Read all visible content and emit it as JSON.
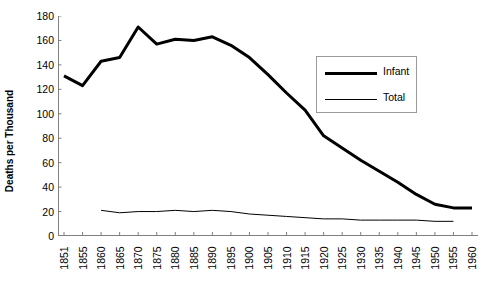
{
  "chart_data": {
    "type": "line",
    "title": "",
    "xlabel": "",
    "ylabel": "Deaths per Thousand",
    "ylim": [
      0,
      180
    ],
    "ytick_step": 20,
    "yticks": [
      0,
      20,
      40,
      60,
      80,
      100,
      120,
      140,
      160,
      180
    ],
    "grid": false,
    "legend_position": "inside-upper-right",
    "x": [
      1851,
      1855,
      1860,
      1865,
      1870,
      1875,
      1880,
      1885,
      1890,
      1895,
      1900,
      1905,
      1910,
      1915,
      1920,
      1925,
      1930,
      1935,
      1940,
      1945,
      1950,
      1955,
      1960
    ],
    "xtick_labels": [
      "1851",
      "1855",
      "1860",
      "1865",
      "1870",
      "1875",
      "1880",
      "1885",
      "1890",
      "1895",
      "1900",
      "1905",
      "1910",
      "1915",
      "1920",
      "1925",
      "1930",
      "1935",
      "1940",
      "1945",
      "1950",
      "1955",
      "1960"
    ],
    "series": [
      {
        "name": "Infant",
        "line_width": 3,
        "color": "#000000",
        "values": [
          131,
          123,
          143,
          146,
          171,
          157,
          161,
          160,
          163,
          156,
          146,
          132,
          117,
          103,
          82,
          72,
          62,
          53,
          44,
          34,
          26,
          23,
          23
        ]
      },
      {
        "name": "Total",
        "line_width": 1,
        "color": "#000000",
        "values": [
          null,
          null,
          21,
          19,
          20,
          20,
          21,
          20,
          21,
          20,
          18,
          17,
          16,
          15,
          14,
          14,
          13,
          13,
          13,
          13,
          12,
          12,
          null
        ]
      }
    ]
  },
  "legend": {
    "items": [
      {
        "label": "Infant"
      },
      {
        "label": "Total"
      }
    ]
  },
  "axes": {
    "y_title": "Deaths per Thousand"
  }
}
